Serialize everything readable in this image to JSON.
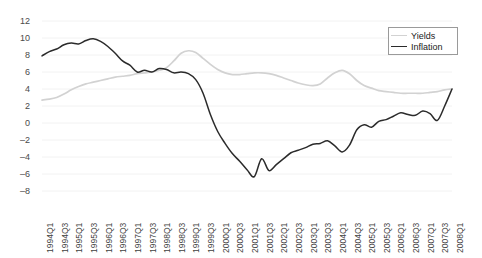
{
  "chart_data": {
    "type": "line",
    "title": "",
    "subtitle": "",
    "xlabel": "",
    "ylabel": "",
    "grid": true,
    "legend_position": "top-right",
    "ylim": [
      -8,
      12
    ],
    "ytick_values": [
      12,
      10,
      8,
      6,
      4,
      2,
      0,
      -2,
      -4,
      -6,
      -8
    ],
    "ytick_labels": [
      "12",
      "10",
      "8",
      "6",
      "4",
      "2",
      "0",
      "–2",
      "–4",
      "–6",
      "–8"
    ],
    "x": [
      "1994Q1",
      "1994Q2",
      "1994Q3",
      "1994Q4",
      "1995Q1",
      "1995Q2",
      "1995Q3",
      "1995Q4",
      "1996Q1",
      "1996Q2",
      "1996Q3",
      "1996Q4",
      "1997Q1",
      "1997Q2",
      "1997Q3",
      "1997Q4",
      "1998Q1",
      "1998Q2",
      "1998Q3",
      "1998Q4",
      "1999Q1",
      "1999Q2",
      "1999Q3",
      "1999Q4",
      "2000Q1",
      "2000Q2",
      "2000Q3",
      "2000Q4",
      "2001Q1",
      "2001Q2",
      "2001Q3",
      "2001Q4",
      "2002Q1",
      "2002Q2",
      "2002Q3",
      "2002Q4",
      "2003Q1",
      "2003Q2",
      "2003Q3",
      "2003Q4",
      "2004Q1",
      "2004Q2",
      "2004Q3",
      "2004Q4",
      "2005Q1",
      "2005Q2",
      "2005Q3",
      "2005Q4",
      "2006Q1",
      "2006Q2",
      "2006Q3",
      "2006Q4",
      "2007Q1",
      "2007Q2",
      "2007Q3",
      "2007Q4",
      "2008Q1"
    ],
    "xtick_labels": [
      "1994Q1",
      "1994Q3",
      "1995Q1",
      "1995Q3",
      "1996Q1",
      "1996Q3",
      "1997Q1",
      "1997Q3",
      "1998Q1",
      "1998Q3",
      "1999Q1",
      "1999Q3",
      "2000Q1",
      "2000Q3",
      "2001Q1",
      "2001Q3",
      "2002Q1",
      "2002Q3",
      "2003Q1",
      "2003Q3",
      "2004Q1",
      "2004Q3",
      "2005Q1",
      "2005Q3",
      "2006Q1",
      "2006Q3",
      "2007Q1",
      "2007Q3",
      "2008Q1"
    ],
    "series": [
      {
        "name": "Yields",
        "color": "#d2d2d2",
        "values": [
          2.7,
          2.8,
          3.0,
          3.4,
          3.9,
          4.3,
          4.6,
          4.8,
          5.0,
          5.2,
          5.4,
          5.5,
          5.6,
          5.8,
          5.9,
          6.0,
          6.2,
          6.5,
          7.3,
          8.2,
          8.5,
          8.3,
          7.6,
          6.9,
          6.3,
          5.9,
          5.7,
          5.7,
          5.8,
          5.9,
          5.9,
          5.8,
          5.6,
          5.3,
          5.0,
          4.7,
          4.5,
          4.4,
          4.6,
          5.3,
          5.9,
          6.2,
          5.8,
          5.0,
          4.4,
          4.1,
          3.8,
          3.7,
          3.6,
          3.5,
          3.5,
          3.5,
          3.5,
          3.6,
          3.7,
          3.9,
          4.0
        ]
      },
      {
        "name": "Inflation",
        "color": "#2b2b2b",
        "values": [
          7.9,
          8.4,
          8.7,
          9.2,
          9.4,
          9.3,
          9.7,
          9.9,
          9.6,
          9.0,
          8.2,
          7.3,
          6.8,
          6.0,
          6.2,
          6.0,
          6.4,
          6.3,
          5.9,
          6.0,
          5.8,
          5.1,
          3.5,
          1.0,
          -1.0,
          -2.4,
          -3.6,
          -4.5,
          -5.5,
          -6.3,
          -4.2,
          -5.6,
          -4.9,
          -4.2,
          -3.5,
          -3.2,
          -2.9,
          -2.5,
          -2.4,
          -2.1,
          -2.7,
          -3.4,
          -2.6,
          -0.8,
          -0.2,
          -0.5,
          0.2,
          0.4,
          0.8,
          1.2,
          1.0,
          0.9,
          1.4,
          1.1,
          0.3,
          2.0,
          4.0
        ]
      }
    ]
  },
  "legend": {
    "items": [
      {
        "label": "Yields"
      },
      {
        "label": "Inflation"
      }
    ]
  },
  "colors": {
    "yields": "#d2d2d2",
    "inflation": "#2b2b2b",
    "grid": "#f2f2f2",
    "axis_text": "#3f3f3f"
  }
}
